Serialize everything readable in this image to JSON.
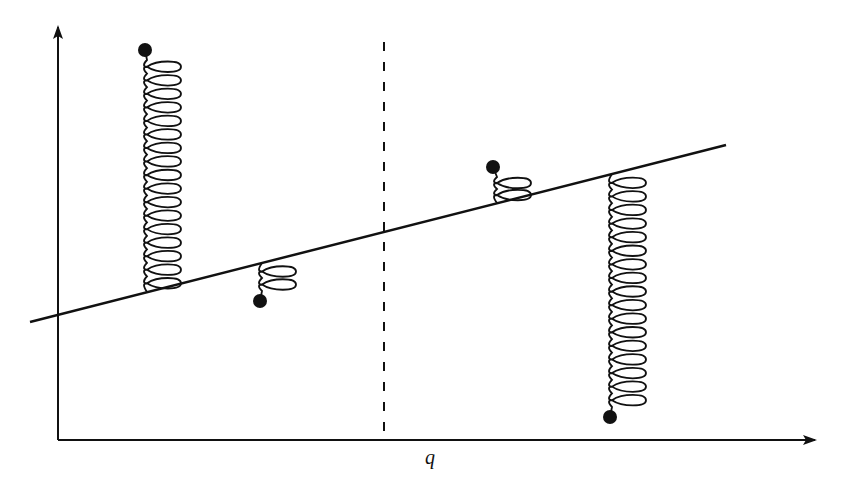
{
  "diagram": {
    "colors": {
      "ink": "#111111",
      "background": "#ffffff"
    },
    "axes": {
      "x_label": "q",
      "y_label": "",
      "origin": [
        58,
        440
      ],
      "x_end": [
        815,
        440
      ],
      "y_end": [
        58,
        25
      ]
    },
    "sloped_line": {
      "from": [
        30,
        322
      ],
      "to": [
        726,
        145
      ]
    },
    "dashed_line": {
      "x": 384,
      "y_top": 42,
      "y_bottom": 432
    },
    "springs": [
      {
        "id": "left-tall",
        "anchor_x": 147,
        "anchor_y": 292,
        "ball": [
          145,
          50
        ],
        "coils": 17,
        "direction": "up"
      },
      {
        "id": "left-short",
        "anchor_x": 262,
        "anchor_y": 263,
        "ball": [
          260,
          301
        ],
        "coils": 2,
        "direction": "down"
      },
      {
        "id": "right-short",
        "anchor_x": 497,
        "anchor_y": 203,
        "ball": [
          493,
          167
        ],
        "coils": 2,
        "direction": "up"
      },
      {
        "id": "right-tall",
        "anchor_x": 612,
        "anchor_y": 174,
        "ball": [
          610,
          417
        ],
        "coils": 17,
        "direction": "down"
      }
    ]
  }
}
